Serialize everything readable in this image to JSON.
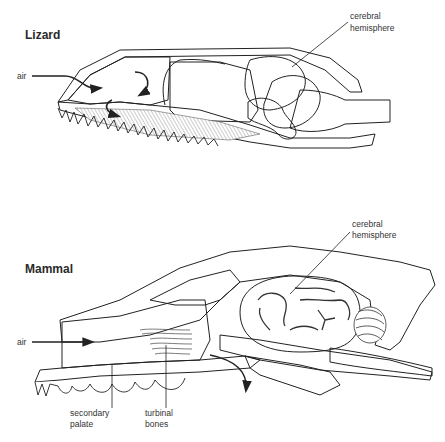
{
  "diagram": {
    "lizard": {
      "title": "Lizard",
      "labels": {
        "air": "air",
        "cerebral_line1": "cerebral",
        "cerebral_line2": "hemisphere"
      }
    },
    "mammal": {
      "title": "Mammal",
      "labels": {
        "air": "air",
        "cerebral_line1": "cerebral",
        "cerebral_line2": "hemisphere",
        "palate_line1": "secondary",
        "palate_line2": "palate",
        "turbinal_line1": "turbinal",
        "turbinal_line2": "bones"
      }
    },
    "colors": {
      "ink": "#222222",
      "background": "#ffffff",
      "brain_shade": "#e8e8e8"
    }
  }
}
